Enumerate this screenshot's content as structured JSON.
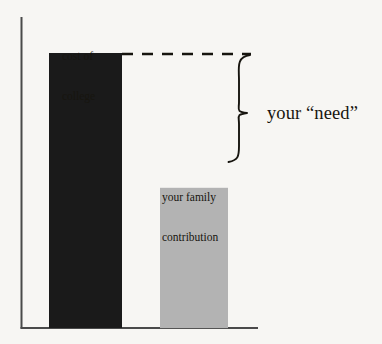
{
  "figure": {
    "background_color": "#f7f6f3",
    "ink_color": "#17150f"
  },
  "chart_data": {
    "type": "bar",
    "title": "",
    "xlabel": "",
    "ylabel": "",
    "grid": false,
    "legend": false,
    "axis_ranges": {
      "y": [
        0,
        100
      ]
    },
    "categories": [
      "cost of college",
      "your family contribution"
    ],
    "values": [
      100,
      51
    ],
    "value_units": "relative (percent of cost of college)",
    "series": [
      {
        "name": "amount",
        "values": [
          100,
          51
        ],
        "colors": [
          "#1a1a1a",
          "#b3b3b3"
        ]
      }
    ],
    "annotations": [
      {
        "name": "cost-of-college-label",
        "text": "cost of\ncollege",
        "attached_to": "bar-cost-of-college",
        "position": "above-bar"
      },
      {
        "name": "family-contribution-label",
        "text": "your family\ncontribution",
        "attached_to": "bar-family-contribution",
        "position": "inside-bar-top"
      },
      {
        "name": "need-bracket-label",
        "text": "your “need”",
        "position": "right-of-brace",
        "describes": "gap between cost of college and your family contribution"
      },
      {
        "name": "cost-level-dashed-line",
        "type": "dashed-line",
        "from_value": 100,
        "note": "extends the top of the cost-of-college bar to the right"
      },
      {
        "name": "need-curly-brace",
        "type": "curly-brace",
        "spans_values": [
          51,
          100
        ]
      }
    ]
  },
  "labels": {
    "cost_line1": "cost of",
    "cost_line2": "college",
    "family_line1": "your family",
    "family_line2": "contribution",
    "need": "your “need”"
  },
  "colors": {
    "bar_cost": "#1a1a1a",
    "bar_family": "#b3b3b3",
    "axis": "#4a4a4a",
    "text": "#17150f",
    "background": "#f7f6f3"
  }
}
